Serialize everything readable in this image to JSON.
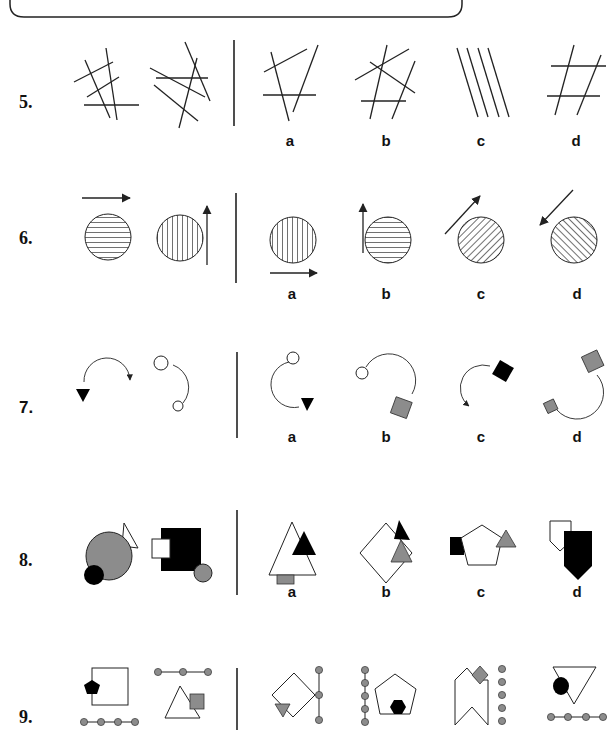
{
  "header_box": {
    "text": "",
    "note": "clipped instruction box at top edge; text not legible"
  },
  "colors": {
    "ink": "#222222",
    "gray_fill": "#8c8c8c",
    "black_fill": "#000000",
    "white_fill": "#ffffff"
  },
  "questions": [
    {
      "number": "5.",
      "description": "crossing straight lines",
      "sequence": [
        "4 crossing lines with one horizontal",
        "5 crossing lines with one horizontal"
      ],
      "options": [
        {
          "label": "a",
          "content": "3 lines with one horizontal"
        },
        {
          "label": "b",
          "content": "5 crossing lines with one horizontal"
        },
        {
          "label": "c",
          "content": "4 parallel diagonal lines"
        },
        {
          "label": "d",
          "content": "hash: 2 horizontal + 2 slanted lines"
        }
      ]
    },
    {
      "number": "6.",
      "description": "hatched circles with arrows",
      "sequence": [
        "horizontal-hatched circle, arrow right above",
        "vertical-hatched circle, arrow up on right"
      ],
      "options": [
        {
          "label": "a",
          "content": "vertical-hatched circle, arrow right below"
        },
        {
          "label": "b",
          "content": "horizontal-hatched circle, arrow up on left"
        },
        {
          "label": "c",
          "content": "diagonal-hatched circle, arrow up-right"
        },
        {
          "label": "d",
          "content": "diagonal-hatched circle, arrow down-left"
        }
      ]
    },
    {
      "number": "7.",
      "description": "arcs with end shapes",
      "sequence": [
        "black triangle + clockwise arc arrow",
        "arc with two small circles"
      ],
      "options": [
        {
          "label": "a",
          "content": "arc with circle and black triangle"
        },
        {
          "label": "b",
          "content": "arc with circle and gray square"
        },
        {
          "label": "c",
          "content": "arc arrow with black square"
        },
        {
          "label": "d",
          "content": "arc with two gray squares"
        }
      ]
    },
    {
      "number": "8.",
      "description": "overlapping shapes",
      "sequence": [
        "gray circle, black circle, white triangle",
        "black square, white square, gray circle"
      ],
      "options": [
        {
          "label": "a",
          "content": "white triangle, black triangle, gray rectangle"
        },
        {
          "label": "b",
          "content": "white diamond, black triangle, gray triangle"
        },
        {
          "label": "c",
          "content": "white pentagon, black square, gray triangle"
        },
        {
          "label": "d",
          "content": "white pentagon-arrow, black pentagon-arrow"
        }
      ]
    },
    {
      "number": "9.",
      "description": "shapes with dotted chains",
      "sequence": [
        "square + black pentagon + 4-dot chain",
        "triangle + gray square + 3-dot chain"
      ],
      "options": [
        {
          "label": "a",
          "content": "diamond + gray triangle + 3-dot vertical chain"
        },
        {
          "label": "b",
          "content": "pentagon + black hexagon + 5-dot vertical chain"
        },
        {
          "label": "c",
          "content": "chevron shape + gray diamond + 5 dots"
        },
        {
          "label": "d",
          "content": "inverted triangle + black circle + 4-dot chain"
        }
      ]
    }
  ]
}
